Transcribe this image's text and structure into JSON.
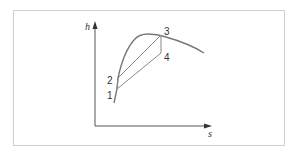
{
  "diagram": {
    "type": "h-s diagram (vapor dome with cycle)",
    "axes": {
      "y_label": "h",
      "x_label": "s"
    },
    "points": [
      {
        "id": "1",
        "label": "1"
      },
      {
        "id": "2",
        "label": "2"
      },
      {
        "id": "3",
        "label": "3"
      },
      {
        "id": "4",
        "label": "4"
      }
    ],
    "colors": {
      "curve": "#777777",
      "axis": "#444444",
      "frame": "#cfcfcf"
    }
  }
}
